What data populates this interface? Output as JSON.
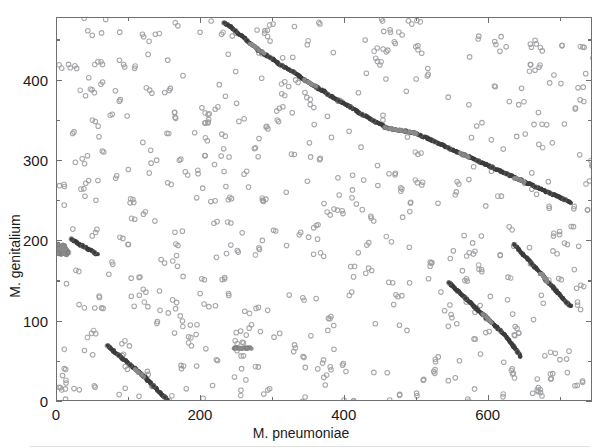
{
  "figure": {
    "title": "",
    "background": "#ffffff"
  },
  "axes": {
    "x_title": "M. pneumoniae",
    "y_title": "M. genitalium",
    "x_ticklabels": [
      "0",
      "200",
      "400",
      "600"
    ],
    "y_ticklabels": [
      "0",
      "100",
      "200",
      "300",
      "400"
    ],
    "tick_color": "#6d6f72",
    "label_color": "#1b1b1b"
  },
  "chart_data": {
    "type": "scatter",
    "title": "",
    "xlabel": "M. pneumoniae",
    "ylabel": "M. genitalium",
    "xlim": [
      0,
      745
    ],
    "ylim": [
      0,
      478
    ],
    "grid": false,
    "legend": null,
    "xticks": [
      0,
      200,
      400,
      600
    ],
    "yticks": [
      0,
      100,
      200,
      300,
      400
    ],
    "xminorticks": [
      100,
      300,
      500,
      700
    ],
    "yminorticks": [
      50,
      150,
      250,
      350,
      450
    ],
    "marker": "open-circle",
    "marker_size_px": 4.6,
    "marker_colors": {
      "background": "#9a9ca0",
      "dark": "#3c3c3c",
      "mid": "#8a8a8a"
    },
    "series": [
      {
        "name": "syntenic-diagonal-main",
        "color": "#3c3c3c",
        "description": "Long antidiagonal chain of conserved gene order from upper-left to mid-right with gray gap segments",
        "points": [
          [
            232,
            472
          ],
          [
            236,
            470
          ],
          [
            240,
            468
          ],
          [
            244,
            465
          ],
          [
            248,
            462
          ],
          [
            252,
            459
          ],
          [
            256,
            456
          ],
          [
            260,
            453
          ],
          [
            264,
            450
          ],
          [
            268,
            447
          ],
          [
            272,
            444
          ],
          [
            276,
            441
          ],
          [
            280,
            438
          ],
          [
            284,
            436
          ],
          [
            288,
            433
          ],
          [
            292,
            431
          ],
          [
            296,
            429
          ],
          [
            300,
            427
          ],
          [
            304,
            424
          ],
          [
            308,
            421
          ],
          [
            312,
            419
          ],
          [
            316,
            417
          ],
          [
            320,
            415
          ],
          [
            324,
            413
          ],
          [
            328,
            411
          ],
          [
            332,
            409
          ],
          [
            336,
            406
          ],
          [
            340,
            403
          ],
          [
            344,
            401
          ],
          [
            348,
            399
          ],
          [
            352,
            396
          ],
          [
            356,
            394
          ],
          [
            360,
            392
          ],
          [
            364,
            390
          ],
          [
            368,
            388
          ],
          [
            372,
            386
          ],
          [
            376,
            383
          ],
          [
            380,
            381
          ],
          [
            384,
            379
          ],
          [
            388,
            377
          ],
          [
            392,
            375
          ],
          [
            396,
            373
          ],
          [
            400,
            371
          ],
          [
            404,
            369
          ],
          [
            408,
            367
          ],
          [
            412,
            365
          ],
          [
            416,
            363
          ],
          [
            420,
            360
          ],
          [
            424,
            358
          ],
          [
            428,
            356
          ],
          [
            432,
            354
          ],
          [
            436,
            352
          ],
          [
            440,
            350
          ],
          [
            444,
            348
          ],
          [
            448,
            346
          ],
          [
            452,
            344
          ],
          [
            456,
            342
          ],
          [
            463,
            340
          ],
          [
            470,
            339
          ],
          [
            477,
            338
          ],
          [
            484,
            337
          ],
          [
            490,
            336
          ],
          [
            496,
            335
          ],
          [
            500,
            334
          ],
          [
            505,
            332
          ],
          [
            510,
            330
          ],
          [
            515,
            328
          ],
          [
            520,
            326
          ],
          [
            525,
            324
          ],
          [
            530,
            322
          ],
          [
            535,
            320
          ],
          [
            540,
            318
          ],
          [
            545,
            316
          ],
          [
            550,
            314
          ],
          [
            555,
            312
          ],
          [
            560,
            310
          ],
          [
            565,
            308
          ],
          [
            570,
            306
          ],
          [
            575,
            304
          ],
          [
            580,
            302
          ],
          [
            585,
            300
          ],
          [
            590,
            298
          ],
          [
            595,
            296
          ],
          [
            600,
            294
          ],
          [
            605,
            292
          ],
          [
            610,
            290
          ],
          [
            615,
            288
          ],
          [
            620,
            286
          ],
          [
            625,
            284
          ],
          [
            630,
            282
          ],
          [
            635,
            280
          ],
          [
            640,
            278
          ],
          [
            645,
            276
          ],
          [
            650,
            274
          ],
          [
            655,
            272
          ],
          [
            660,
            270
          ],
          [
            665,
            268
          ],
          [
            670,
            266
          ],
          [
            675,
            264
          ],
          [
            680,
            262
          ],
          [
            685,
            260
          ],
          [
            690,
            258
          ],
          [
            695,
            256
          ],
          [
            700,
            254
          ],
          [
            705,
            252
          ],
          [
            710,
            250
          ],
          [
            715,
            248
          ]
        ]
      },
      {
        "name": "syntenic-diagonal-upper",
        "color": "#3c3c3c",
        "description": "Upper-left segment running from about (230,472) down-right, with gray inserts near (270,443) and (350,400)",
        "points": []
      },
      {
        "name": "syntenic-diagonal-lowerleft",
        "color": "#3c3c3c",
        "description": "Short antidiagonal from (70,70) to (155,2)",
        "points": [
          [
            70,
            70
          ],
          [
            74,
            67
          ],
          [
            78,
            64
          ],
          [
            82,
            61
          ],
          [
            86,
            58
          ],
          [
            90,
            55
          ],
          [
            94,
            52
          ],
          [
            98,
            49
          ],
          [
            102,
            46
          ],
          [
            106,
            43
          ],
          [
            110,
            40
          ],
          [
            114,
            37
          ],
          [
            118,
            34
          ],
          [
            122,
            31
          ],
          [
            126,
            27
          ],
          [
            130,
            24
          ],
          [
            134,
            20
          ],
          [
            138,
            16
          ],
          [
            142,
            12
          ],
          [
            146,
            9
          ],
          [
            150,
            6
          ],
          [
            154,
            2
          ]
        ]
      },
      {
        "name": "syntenic-diagonal-200block",
        "color": "#3c3c3c",
        "description": "Very short antidiagonal near y=200, x from 20 to 55",
        "points": [
          [
            20,
            203
          ],
          [
            24,
            200
          ],
          [
            28,
            198
          ],
          [
            32,
            196
          ],
          [
            36,
            194
          ],
          [
            40,
            192
          ],
          [
            44,
            190
          ],
          [
            48,
            188
          ],
          [
            52,
            186
          ],
          [
            56,
            184
          ]
        ]
      },
      {
        "name": "syntenic-diagonal-rightA",
        "color": "#3c3c3c",
        "description": "Diagonal in lower-right from about (545,148) to (640,55)",
        "points": [
          [
            545,
            148
          ],
          [
            550,
            144
          ],
          [
            556,
            139
          ],
          [
            562,
            134
          ],
          [
            568,
            129
          ],
          [
            574,
            124
          ],
          [
            580,
            119
          ],
          [
            586,
            114
          ],
          [
            592,
            109
          ],
          [
            598,
            104
          ],
          [
            604,
            99
          ],
          [
            610,
            94
          ],
          [
            616,
            89
          ],
          [
            622,
            84
          ],
          [
            628,
            77
          ],
          [
            634,
            70
          ],
          [
            640,
            62
          ],
          [
            645,
            56
          ]
        ]
      },
      {
        "name": "syntenic-diagonal-rightB",
        "color": "#3c3c3c",
        "description": "Diagonal in far right from about (638,195) to (718,118)",
        "points": [
          [
            636,
            196
          ],
          [
            642,
            190
          ],
          [
            648,
            184
          ],
          [
            654,
            178
          ],
          [
            660,
            172
          ],
          [
            666,
            166
          ],
          [
            672,
            160
          ],
          [
            678,
            154
          ],
          [
            684,
            148
          ],
          [
            690,
            142
          ],
          [
            696,
            136
          ],
          [
            702,
            130
          ],
          [
            708,
            124
          ],
          [
            714,
            119
          ]
        ]
      },
      {
        "name": "horizontal-repeat-cluster",
        "color": "#8a8a8a",
        "description": "Short horizontal gray run of repeated matches at y approx 67, x 250-268",
        "points": [
          [
            248,
            67
          ],
          [
            252,
            67
          ],
          [
            256,
            67
          ],
          [
            260,
            67
          ],
          [
            264,
            67
          ],
          [
            268,
            67
          ]
        ]
      },
      {
        "name": "left-edge-repeat-cluster",
        "color": "#8a8a8a",
        "description": "Dense cluster of repeat matches at x approx 0-18, y approx 182-198",
        "points": [
          [
            1,
            196
          ],
          [
            3,
            193
          ],
          [
            5,
            190
          ],
          [
            7,
            188
          ],
          [
            2,
            185
          ],
          [
            6,
            183
          ],
          [
            10,
            191
          ],
          [
            13,
            189
          ],
          [
            16,
            186
          ],
          [
            8,
            196
          ],
          [
            12,
            194
          ]
        ]
      },
      {
        "name": "background-repeat-matches",
        "color": "#9a9ca0",
        "description": "Sparse scatter of isolated short repeat matches distributed over the whole plot",
        "points": []
      }
    ]
  }
}
